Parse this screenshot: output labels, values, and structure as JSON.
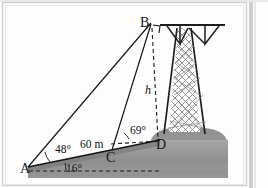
{
  "figure": {
    "kind": "geometry-diagram",
    "points": {
      "A": {
        "label": "A",
        "x": 28,
        "y": 167
      },
      "B": {
        "label": "B",
        "x": 152,
        "y": 22
      },
      "C": {
        "label": "C",
        "x": 112,
        "y": 153
      },
      "D": {
        "label": "D",
        "x": 160,
        "y": 140
      }
    },
    "angles": {
      "at_A_elevation_to_B": {
        "label": "48°",
        "value": 48,
        "unit": "degree",
        "x": 52,
        "y": 150
      },
      "at_A_slope": {
        "label": "16°",
        "value": 16,
        "unit": "degree",
        "x": 74,
        "y": 168
      },
      "at_C_to_B": {
        "label": "69°",
        "value": 69,
        "unit": "degree",
        "x": 133,
        "y": 131
      }
    },
    "lengths": {
      "AC": {
        "label": "60 m",
        "value": 60,
        "unit": "m",
        "x": 77,
        "y": 144
      }
    },
    "unknowns": {
      "height_BD": {
        "label": "h",
        "x": 148,
        "y": 92
      }
    },
    "markers": {
      "right_angle_at_B": "right-angle-square"
    },
    "colors": {
      "ink": "#141414",
      "line": "#1d1d1d",
      "ground_dark": "#8d8d8d",
      "ground_light": "#b9b9b9",
      "hill": "#9a9a9a",
      "lattice": "#6d6d6d",
      "page": "#fdfdfd",
      "frame": "#c9c9c9"
    },
    "objects": {
      "tower": "lattice-transmission-tower",
      "ground": "sloped-hillside",
      "hill": "rounded-hill",
      "crossarm": "tower-crossarm"
    }
  }
}
